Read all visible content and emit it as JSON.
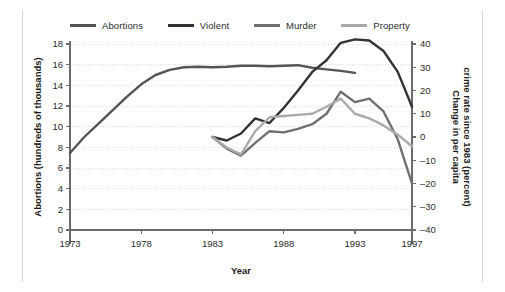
{
  "chart_data": {
    "type": "line",
    "title": "",
    "xlabel": "Year",
    "ylabel": "Abortions (hundreds of thousands)",
    "y2label": "Change in per capita crime rate since 1983 (percent)",
    "xlim": [
      1973,
      1997
    ],
    "ylim": [
      0,
      18
    ],
    "y2lim": [
      -40,
      40
    ],
    "xticks": [
      "1973",
      "1978",
      "1983",
      "1988",
      "1993",
      "1997"
    ],
    "xtick_values": [
      1973,
      1978,
      1983,
      1988,
      1993,
      1997
    ],
    "yticks": [
      "0",
      "2",
      "4",
      "6",
      "8",
      "10",
      "12",
      "14",
      "16",
      "18"
    ],
    "ytick_values": [
      0,
      2,
      4,
      6,
      8,
      10,
      12,
      14,
      16,
      18
    ],
    "y2ticks": [
      "-40",
      "-30",
      "-20",
      "-10",
      "0",
      "10",
      "20",
      "30",
      "40"
    ],
    "y2tick_values": [
      -40,
      -30,
      -20,
      -10,
      0,
      10,
      20,
      30,
      40
    ],
    "grid": true,
    "grid_style": "dotted-horizontal",
    "legend_position": "top",
    "series": [
      {
        "name": "Abortions",
        "axis": "left",
        "color": "#555555",
        "width": 2.4,
        "x": [
          1973,
          1974,
          1975,
          1976,
          1977,
          1978,
          1979,
          1980,
          1981,
          1982,
          1983,
          1984,
          1985,
          1986,
          1987,
          1988,
          1989,
          1990,
          1991,
          1992,
          1993
        ],
        "values": [
          7.45,
          9.0,
          10.3,
          11.6,
          12.9,
          14.1,
          15.0,
          15.5,
          15.75,
          15.8,
          15.75,
          15.8,
          15.9,
          15.9,
          15.85,
          15.9,
          15.95,
          15.7,
          15.55,
          15.4,
          15.2
        ]
      },
      {
        "name": "Violent",
        "axis": "right",
        "color": "#333333",
        "width": 2.4,
        "x": [
          1983,
          1984,
          1985,
          1986,
          1987,
          1988,
          1989,
          1990,
          1991,
          1992,
          1993,
          1994,
          1995,
          1996,
          1997
        ],
        "values": [
          0.0,
          -1.5,
          1.5,
          8.0,
          6.0,
          12.5,
          20.0,
          28.0,
          33.0,
          40.5,
          42.0,
          41.5,
          37.0,
          28.0,
          13.0
        ]
      },
      {
        "name": "Murder",
        "axis": "right",
        "color": "#707070",
        "width": 2.4,
        "x": [
          1983,
          1984,
          1985,
          1986,
          1987,
          1988,
          1989,
          1990,
          1991,
          1992,
          1993,
          1994,
          1995,
          1996,
          1997
        ],
        "values": [
          0.0,
          -5.0,
          -8.0,
          -2.5,
          2.5,
          2.0,
          3.5,
          5.5,
          10.0,
          19.5,
          15.0,
          16.5,
          11.0,
          -1.0,
          -20.0
        ]
      },
      {
        "name": "Property",
        "axis": "right",
        "color": "#aaaaaa",
        "width": 2.4,
        "x": [
          1983,
          1984,
          1985,
          1986,
          1987,
          1988,
          1989,
          1990,
          1991,
          1992,
          1993,
          1994,
          1995,
          1996,
          1997
        ],
        "values": [
          0.0,
          -4.5,
          -7.5,
          2.5,
          8.5,
          9.0,
          9.5,
          10.0,
          13.0,
          16.5,
          10.0,
          8.0,
          5.0,
          1.0,
          -4.0
        ]
      }
    ]
  },
  "legend": {
    "items": [
      {
        "label": "Abortions",
        "color": "#555555"
      },
      {
        "label": "Violent",
        "color": "#333333"
      },
      {
        "label": "Murder",
        "color": "#707070"
      },
      {
        "label": "Property",
        "color": "#aaaaaa"
      }
    ]
  },
  "axes": {
    "left_title": "Abortions (hundreds of thousands)",
    "right_title": "Change in per capita crime rate since 1983 (percent)",
    "bottom_title": "Year"
  },
  "colors": {
    "axis": "#6b6b6b",
    "grid": "#d9d9d9",
    "text": "#2b2b2b",
    "background": "#ffffff",
    "frame_rule": "#d7d7d7"
  }
}
